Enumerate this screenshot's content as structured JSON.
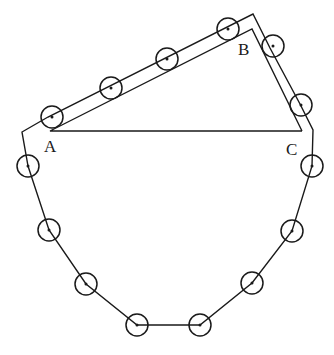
{
  "diagram": {
    "labels": {
      "A": "A",
      "B": "B",
      "C": "C"
    },
    "colors": {
      "stroke": "#1a1a1a",
      "background": "#ffffff"
    },
    "points": {
      "A": [
        50,
        131
      ],
      "B": [
        252,
        29
      ],
      "C": [
        302,
        131
      ]
    },
    "circle_count": 16
  }
}
